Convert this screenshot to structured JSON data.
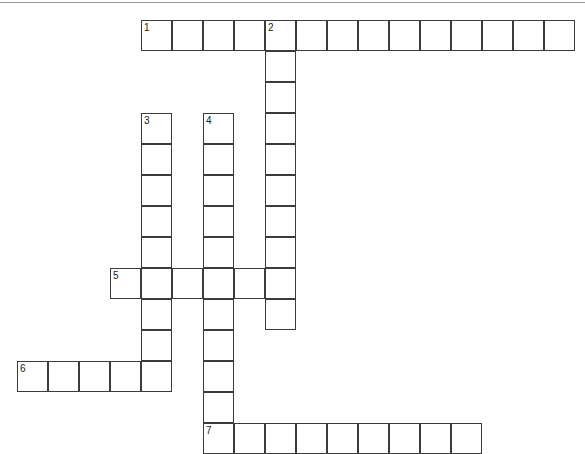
{
  "page": {
    "background_color": "#ffffff",
    "cell_border_color": "#3c3c3c",
    "rule_color": "#9a9a9a",
    "width": 585,
    "height": 447
  },
  "grid": {
    "cell_size": 31,
    "origin_x": 17,
    "origin_y": 20,
    "columns": 18,
    "rows": 14
  },
  "entries": [
    {
      "number": "1",
      "direction": "across",
      "col": 4,
      "row": 0,
      "length": 14
    },
    {
      "number": "2",
      "direction": "down",
      "col": 8,
      "row": 0,
      "length": 10
    },
    {
      "number": "3",
      "direction": "down",
      "col": 4,
      "row": 3,
      "length": 9
    },
    {
      "number": "4",
      "direction": "down",
      "col": 6,
      "row": 3,
      "length": 11
    },
    {
      "number": "5",
      "direction": "across",
      "col": 3,
      "row": 8,
      "length": 6
    },
    {
      "number": "6",
      "direction": "across",
      "col": 0,
      "row": 11,
      "length": 5
    },
    {
      "number": "7",
      "direction": "across",
      "col": 6,
      "row": 13,
      "length": 9
    }
  ],
  "labels": [
    {
      "number": "1",
      "col": 4,
      "row": 0
    },
    {
      "number": "2",
      "col": 8,
      "row": 0
    },
    {
      "number": "3",
      "col": 4,
      "row": 3
    },
    {
      "number": "4",
      "col": 6,
      "row": 3
    },
    {
      "number": "5",
      "col": 3,
      "row": 8
    },
    {
      "number": "6",
      "col": 0,
      "row": 11
    },
    {
      "number": "7",
      "col": 6,
      "row": 13
    }
  ]
}
